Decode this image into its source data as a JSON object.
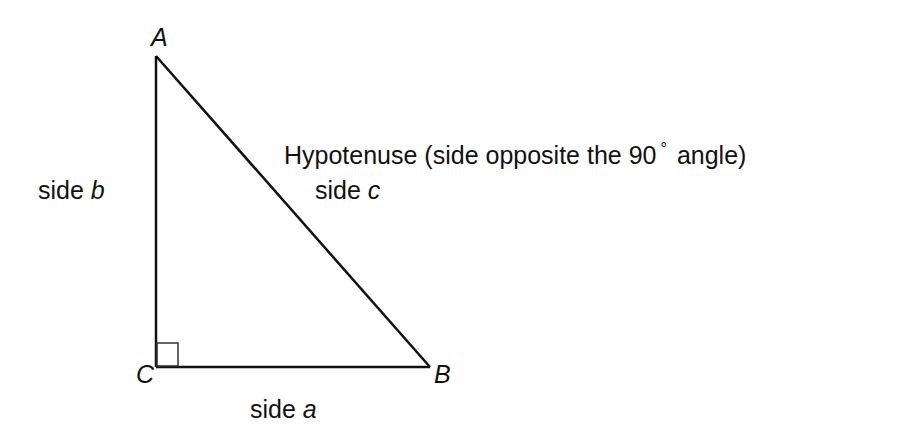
{
  "diagram": {
    "type": "right-triangle",
    "vertices": {
      "A": {
        "label": "A",
        "x": 156,
        "y": 56
      },
      "B": {
        "label": "B",
        "x": 430,
        "y": 367
      },
      "C": {
        "label": "C",
        "x": 156,
        "y": 367
      }
    },
    "right_angle_at": "C",
    "stroke_color": "#111111",
    "sides": {
      "a": {
        "prefix": "side",
        "var": "a"
      },
      "b": {
        "prefix": "side",
        "var": "b"
      },
      "c": {
        "prefix": "side",
        "var": "c"
      }
    },
    "hypotenuse_note": {
      "text_before": "Hypotenuse (side opposite the 90",
      "degree_symbol": "°",
      "text_after": "angle)"
    }
  }
}
